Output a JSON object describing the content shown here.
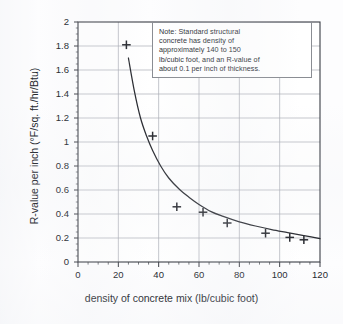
{
  "chart_data": {
    "type": "scatter",
    "title": "",
    "xlabel": "density of concrete mix (lb/cubic foot)",
    "ylabel": "R-value per inch (°F/sq. ft./hr/Btu)",
    "xlim": [
      0,
      120
    ],
    "ylim": [
      0,
      2
    ],
    "grid": true,
    "legend": "none",
    "x_ticks": [
      "0",
      "20",
      "40",
      "60",
      "80",
      "100",
      "120"
    ],
    "x_tick_values": [
      0,
      20,
      40,
      60,
      80,
      100,
      120
    ],
    "x_minor_step": 5,
    "y_ticks": [
      "0",
      "0.2",
      "0.4",
      "0.6",
      "0.8",
      "1",
      "1.2",
      "1.4",
      "1.6",
      "1.8",
      "2"
    ],
    "y_tick_values": [
      0,
      0.2,
      0.4,
      0.6,
      0.8,
      1,
      1.2,
      1.4,
      1.6,
      1.8,
      2
    ],
    "marker": "plus",
    "points": [
      {
        "x": 24,
        "y": 1.81
      },
      {
        "x": 37,
        "y": 1.05
      },
      {
        "x": 49,
        "y": 0.46
      },
      {
        "x": 62,
        "y": 0.415
      },
      {
        "x": 74,
        "y": 0.325
      },
      {
        "x": 93,
        "y": 0.24
      },
      {
        "x": 105,
        "y": 0.205
      },
      {
        "x": 112,
        "y": 0.185
      }
    ],
    "series": [
      {
        "name": "measured R-value per inch",
        "x": [
          24,
          37,
          49,
          62,
          74,
          93,
          105,
          112
        ],
        "values": [
          1.81,
          1.05,
          0.46,
          0.415,
          0.325,
          0.24,
          0.205,
          0.185
        ]
      },
      {
        "name": "fitted curve",
        "type": "line",
        "x": [
          25,
          28,
          31,
          34,
          37,
          41,
          45,
          50,
          55,
          60,
          66,
          72,
          80,
          88,
          96,
          104,
          112,
          120
        ],
        "values": [
          1.7,
          1.42,
          1.2,
          1.05,
          0.93,
          0.8,
          0.7,
          0.61,
          0.54,
          0.48,
          0.42,
          0.38,
          0.335,
          0.3,
          0.27,
          0.245,
          0.22,
          0.195
        ]
      }
    ],
    "annotations": {
      "note_box": {
        "lines": [
          "Note: Standard structural",
          "concrete has density of",
          "approximately 140 to 150",
          "lb/cubic foot, and an R-value of",
          "about 0.1 per inch of thickness."
        ]
      }
    },
    "colors": {
      "axis": "#3a3d44",
      "grid": "#a9acb4",
      "curve": "#26282e",
      "marker": "#26282e",
      "background": "#fdfdfe",
      "note_border": "#8a8d93"
    }
  }
}
